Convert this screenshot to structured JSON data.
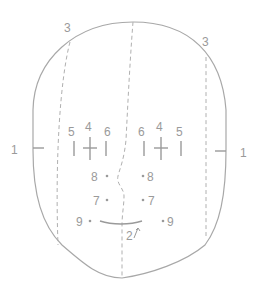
{
  "diagram": {
    "colors": {
      "line": "#a8a8a8",
      "text": "#9a9a9a",
      "background": "#ffffff"
    },
    "labels": {
      "ear_left": "1",
      "ear_right": "1",
      "top_left": "3",
      "top_right": "3",
      "eye_left": [
        "5",
        "4",
        "6"
      ],
      "eye_right": [
        "6",
        "4",
        "5"
      ],
      "row8_left": "8",
      "row8_right": "8",
      "row7_left": "7",
      "row7_right": "7",
      "row9_left": "9",
      "row9_right": "9",
      "mouth": "2"
    }
  }
}
